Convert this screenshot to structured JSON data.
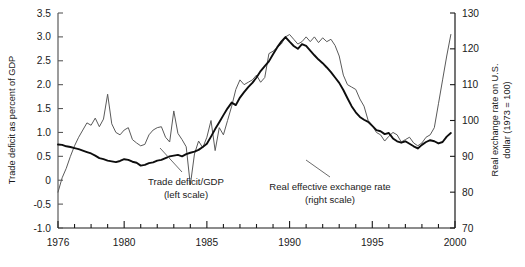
{
  "chart_data": {
    "type": "line",
    "title": "",
    "xlabel": "",
    "ylabel": "Trade deficit as percent of GDP",
    "y2label": "Real exchange rate on U.S. dollar (1973 = 100)",
    "xlim": [
      1976,
      2000
    ],
    "ylim": [
      -1.0,
      3.5
    ],
    "y2lim": [
      70,
      130
    ],
    "grid": false,
    "legend_position": "inline-annotations",
    "x_ticks_major": [
      1976,
      1980,
      1985,
      1990,
      1995,
      2000
    ],
    "x_ticks_minor_step": 1,
    "y_ticks": [
      -1.0,
      -0.5,
      0,
      0.5,
      1.0,
      1.5,
      2.0,
      2.5,
      3.0,
      3.5
    ],
    "y_tick_labels": [
      "-1.0",
      "-0.5",
      "0",
      "0.5",
      "1.0",
      "1.5",
      "2.0",
      "2.5",
      "3.0",
      "3.5"
    ],
    "y2_ticks": [
      70,
      80,
      90,
      100,
      110,
      120,
      130
    ],
    "y2_tick_labels": [
      "70",
      "80",
      "90",
      "100",
      "110",
      "120",
      "130"
    ],
    "annotations": [
      {
        "name": "trade-deficit-annotation",
        "line1": "Trade deficit/GDP",
        "line2": "(left scale)"
      },
      {
        "name": "exchange-rate-annotation",
        "line1": "Real effective exchange rate",
        "line2": "(right scale)"
      }
    ],
    "series": [
      {
        "name": "Trade deficit/GDP",
        "axis": "left",
        "color": "#5a5a5a",
        "width": 1.0,
        "x": [
          1976.0,
          1976.25,
          1976.5,
          1976.75,
          1977.0,
          1977.25,
          1977.5,
          1977.75,
          1978.0,
          1978.25,
          1978.5,
          1978.75,
          1979.0,
          1979.25,
          1979.5,
          1979.75,
          1980.0,
          1980.25,
          1980.5,
          1980.75,
          1981.0,
          1981.25,
          1981.5,
          1981.75,
          1982.0,
          1982.25,
          1982.5,
          1982.75,
          1983.0,
          1983.25,
          1983.5,
          1983.75,
          1984.0,
          1984.25,
          1984.5,
          1984.75,
          1985.0,
          1985.25,
          1985.5,
          1985.75,
          1986.0,
          1986.25,
          1986.5,
          1986.75,
          1987.0,
          1987.25,
          1987.5,
          1987.75,
          1988.0,
          1988.25,
          1988.5,
          1988.75,
          1989.0,
          1989.25,
          1989.5,
          1989.75,
          1990.0,
          1990.25,
          1990.5,
          1990.75,
          1991.0,
          1991.25,
          1991.5,
          1991.75,
          1992.0,
          1992.25,
          1992.5,
          1992.75,
          1993.0,
          1993.25,
          1993.5,
          1993.75,
          1994.0,
          1994.25,
          1994.5,
          1994.75,
          1995.0,
          1995.25,
          1995.5,
          1995.75,
          1996.0,
          1996.25,
          1996.5,
          1996.75,
          1997.0,
          1997.25,
          1997.5,
          1997.75,
          1998.0,
          1998.25,
          1998.5,
          1998.75,
          1999.0,
          1999.25,
          1999.5,
          1999.75
        ],
        "values": [
          -0.25,
          0.05,
          0.25,
          0.5,
          0.72,
          0.9,
          1.05,
          1.2,
          1.15,
          1.3,
          1.12,
          1.28,
          1.8,
          1.18,
          1.0,
          0.95,
          1.05,
          1.1,
          0.85,
          0.78,
          0.72,
          0.75,
          0.95,
          1.05,
          1.1,
          1.12,
          0.9,
          0.8,
          1.45,
          0.98,
          0.85,
          0.7,
          -0.1,
          0.55,
          0.82,
          0.68,
          0.9,
          1.25,
          0.62,
          1.1,
          0.95,
          1.25,
          1.55,
          1.9,
          2.1,
          2.0,
          2.05,
          2.1,
          2.2,
          2.05,
          2.15,
          2.65,
          2.7,
          2.78,
          2.85,
          3.0,
          3.05,
          2.95,
          2.85,
          2.9,
          3.0,
          2.9,
          3.0,
          2.88,
          2.98,
          2.9,
          2.95,
          2.82,
          2.6,
          2.2,
          2.0,
          1.95,
          1.9,
          1.7,
          1.55,
          1.25,
          1.15,
          1.0,
          0.95,
          0.82,
          0.92,
          1.0,
          0.95,
          0.8,
          0.85,
          0.9,
          0.78,
          0.72,
          0.78,
          0.9,
          0.95,
          1.1,
          1.6,
          2.1,
          2.6,
          3.05
        ]
      },
      {
        "name": "Real effective exchange rate",
        "axis": "right",
        "color": "#0d0d0d",
        "width": 1.9,
        "x": [
          1976.0,
          1976.25,
          1976.5,
          1976.75,
          1977.0,
          1977.25,
          1977.5,
          1977.75,
          1978.0,
          1978.25,
          1978.5,
          1978.75,
          1979.0,
          1979.25,
          1979.5,
          1979.75,
          1980.0,
          1980.25,
          1980.5,
          1980.75,
          1981.0,
          1981.25,
          1981.5,
          1981.75,
          1982.0,
          1982.25,
          1982.5,
          1982.75,
          1983.0,
          1983.25,
          1983.5,
          1983.75,
          1984.0,
          1984.25,
          1984.5,
          1984.75,
          1985.0,
          1985.25,
          1985.5,
          1985.75,
          1986.0,
          1986.25,
          1986.5,
          1986.75,
          1987.0,
          1987.25,
          1987.5,
          1987.75,
          1988.0,
          1988.25,
          1988.5,
          1988.75,
          1989.0,
          1989.25,
          1989.5,
          1989.75,
          1990.0,
          1990.25,
          1990.5,
          1990.75,
          1991.0,
          1991.25,
          1991.5,
          1991.75,
          1992.0,
          1992.25,
          1992.5,
          1992.75,
          1993.0,
          1993.25,
          1993.5,
          1993.75,
          1994.0,
          1994.25,
          1994.5,
          1994.75,
          1995.0,
          1995.25,
          1995.5,
          1995.75,
          1996.0,
          1996.25,
          1996.5,
          1996.75,
          1997.0,
          1997.25,
          1997.5,
          1997.75,
          1998.0,
          1998.25,
          1998.5,
          1998.75,
          1999.0,
          1999.25,
          1999.5,
          1999.75
        ],
        "values": [
          93.3,
          93.2,
          92.8,
          92.6,
          92.3,
          92.0,
          91.6,
          91.2,
          90.8,
          90.2,
          89.5,
          89.2,
          88.8,
          88.6,
          88.4,
          88.7,
          89.2,
          89.0,
          88.5,
          88.2,
          87.4,
          87.6,
          88.1,
          88.3,
          88.8,
          89.0,
          89.5,
          90.0,
          90.2,
          90.4,
          90.0,
          90.6,
          91.0,
          91.3,
          91.8,
          92.6,
          93.5,
          95.5,
          97.6,
          99.5,
          101.5,
          103.4,
          105.0,
          104.3,
          106.4,
          107.9,
          109.3,
          110.5,
          112.0,
          113.8,
          115.2,
          116.5,
          118.5,
          120.4,
          122.0,
          123.3,
          122.0,
          120.8,
          120.0,
          121.3,
          120.8,
          119.5,
          118.2,
          117.0,
          116.0,
          114.8,
          113.5,
          112.0,
          110.5,
          108.5,
          106.2,
          104.0,
          102.3,
          101.0,
          100.2,
          99.6,
          98.5,
          97.3,
          97.0,
          96.2,
          96.5,
          95.0,
          94.2,
          93.8,
          94.2,
          93.5,
          92.8,
          92.2,
          93.2,
          94.0,
          94.5,
          94.2,
          93.6,
          94.0,
          95.5,
          96.5
        ]
      }
    ]
  }
}
